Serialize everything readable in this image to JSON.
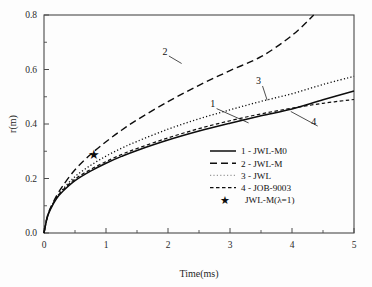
{
  "chart_data": {
    "type": "line",
    "title": "",
    "xlabel": "Time(ms)",
    "ylabel": "r(m)",
    "xlim": [
      0,
      5
    ],
    "ylim": [
      0.0,
      0.8
    ],
    "xticks": [
      "0",
      "1",
      "2",
      "3",
      "4",
      "5"
    ],
    "yticks": [
      "0.0",
      "0.2",
      "0.4",
      "0.6",
      "0.8"
    ],
    "grid": false,
    "legend_position": "center-right",
    "minor_ticks": true,
    "series": [
      {
        "id": "1",
        "name": "1 - JWL-M0",
        "legend_label": "1 - JWL-M0",
        "style": "solid",
        "curve_label": "1",
        "x": [
          0,
          0.05,
          0.1,
          0.2,
          0.3,
          0.5,
          0.75,
          1.0,
          1.25,
          1.5,
          2.0,
          2.5,
          3.0,
          3.5,
          4.0,
          4.5,
          5.0
        ],
        "values": [
          0.0,
          0.055,
          0.085,
          0.125,
          0.152,
          0.192,
          0.227,
          0.256,
          0.281,
          0.303,
          0.341,
          0.374,
          0.403,
          0.43,
          0.455,
          0.489,
          0.521
        ]
      },
      {
        "id": "2",
        "name": "2 - JWL-M",
        "legend_label": "2 - JWL-M",
        "style": "dashed-long",
        "curve_label": "2",
        "x": [
          0,
          0.05,
          0.1,
          0.2,
          0.3,
          0.5,
          0.75,
          1.0,
          1.25,
          1.5,
          2.0,
          2.5,
          3.0,
          3.5,
          4.0,
          4.35
        ],
        "values": [
          0.0,
          0.058,
          0.09,
          0.135,
          0.172,
          0.232,
          0.288,
          0.335,
          0.377,
          0.415,
          0.482,
          0.542,
          0.596,
          0.647,
          0.725,
          0.8
        ]
      },
      {
        "id": "3",
        "name": "3 - JWL",
        "legend_label": "3 - JWL",
        "style": "dotted",
        "curve_label": "3",
        "x": [
          0,
          0.05,
          0.1,
          0.2,
          0.3,
          0.5,
          0.75,
          1.0,
          1.25,
          1.5,
          2.0,
          2.5,
          3.0,
          3.5,
          4.0,
          4.5,
          5.0
        ],
        "values": [
          0.0,
          0.056,
          0.087,
          0.13,
          0.16,
          0.207,
          0.248,
          0.282,
          0.311,
          0.336,
          0.381,
          0.419,
          0.452,
          0.483,
          0.511,
          0.545,
          0.575
        ]
      },
      {
        "id": "4",
        "name": "4 - JOB-9003",
        "legend_label": "4 - JOB-9003",
        "style": "dashed-short",
        "curve_label": "4",
        "x": [
          0,
          0.05,
          0.1,
          0.2,
          0.3,
          0.5,
          0.75,
          1.0,
          1.25,
          1.5,
          2.0,
          2.5,
          3.0,
          3.5,
          4.0,
          4.5,
          5.0
        ],
        "values": [
          0.0,
          0.057,
          0.088,
          0.128,
          0.157,
          0.198,
          0.233,
          0.262,
          0.288,
          0.31,
          0.349,
          0.383,
          0.412,
          0.437,
          0.458,
          0.476,
          0.49
        ]
      }
    ],
    "markers": [
      {
        "id": "star",
        "name": "JWL-M(λ=1)",
        "legend_label": "JWL-M(λ=1)",
        "symbol": "★",
        "x": 0.8,
        "y": 0.288
      }
    ],
    "annotations": [
      {
        "text": "1",
        "x": 2.72,
        "y": 0.462,
        "leader_to_x": 3.3,
        "leader_to_y": 0.404
      },
      {
        "text": "2",
        "x": 1.95,
        "y": 0.655,
        "leader_to_x": 2.22,
        "leader_to_y": 0.622
      },
      {
        "text": "3",
        "x": 3.46,
        "y": 0.545,
        "leader_to_x": 3.6,
        "leader_to_y": 0.487
      },
      {
        "text": "4",
        "x": 4.35,
        "y": 0.398,
        "leader_to_x": 3.98,
        "leader_to_y": 0.446
      }
    ]
  },
  "colors": {
    "axis": "#4a4a4a",
    "curve": "#0d0d0d",
    "dotted_curve": "#9a9a9a",
    "background": "#fdfdfd",
    "text": "#111111"
  }
}
